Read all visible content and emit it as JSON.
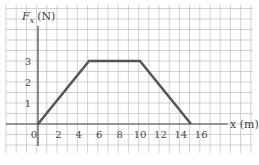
{
  "chart_data": {
    "type": "line",
    "title": "",
    "xlabel": "x (m)",
    "ylabel": "F_x (N)",
    "ylabel_main": "F",
    "ylabel_sub": "x",
    "ylabel_unit": "(N)",
    "x": [
      0,
      5,
      10,
      15
    ],
    "series": [
      {
        "name": "F_x",
        "values": [
          0,
          3,
          3,
          0
        ]
      }
    ],
    "xticks": [
      "0",
      "2",
      "4",
      "6",
      "8",
      "10",
      "12",
      "14",
      "16"
    ],
    "yticks": [
      "1",
      "2",
      "3"
    ],
    "xlim": [
      -3,
      21
    ],
    "ylim": [
      -1.4,
      5.6
    ],
    "grid": true,
    "line_color": "#555555",
    "grid_color": "#bdbdbd"
  }
}
